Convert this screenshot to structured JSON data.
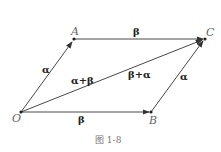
{
  "diagram": {
    "points": {
      "O": {
        "label": "O",
        "x": 21,
        "y": 112
      },
      "A": {
        "label": "A",
        "x": 74,
        "y": 39
      },
      "B": {
        "label": "B",
        "x": 151,
        "y": 112
      },
      "C": {
        "label": "C",
        "x": 205,
        "y": 39
      }
    },
    "vectors": [
      {
        "from": "O",
        "to": "A",
        "label": "α"
      },
      {
        "from": "A",
        "to": "C",
        "label": "β"
      },
      {
        "from": "O",
        "to": "B",
        "label": "β"
      },
      {
        "from": "B",
        "to": "C",
        "label": "α"
      },
      {
        "from": "O",
        "to": "C",
        "label": "α+β"
      },
      {
        "from": "O",
        "to": "C",
        "label": "β+α"
      }
    ],
    "caption": "图  1-8",
    "line_color": "#333333"
  }
}
